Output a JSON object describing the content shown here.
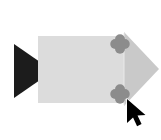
{
  "canvas": {
    "name": "shape-canvas",
    "width": 161,
    "height": 140,
    "background_color": "#ffffff",
    "title": "Block Arrow Shape Selection"
  },
  "shapes": [
    {
      "id": "left-black-triangle",
      "label": "Black Triangle Marker",
      "type": "triangle",
      "fill_color": "#1c1c1c",
      "points": "14,44 14,98 40,80 40,62",
      "direction": "right"
    },
    {
      "id": "arrow-body",
      "label": "Arrow Body Rectangle",
      "type": "rectangle",
      "fill_color": "#dcdcdc",
      "x": 38,
      "y": 36,
      "width": 86,
      "height": 67
    },
    {
      "id": "arrow-head",
      "label": "Arrow Head Triangle",
      "type": "triangle",
      "fill_color": "#c9c9c9",
      "points": "124,32 159,69 124,106",
      "direction": "right"
    },
    {
      "id": "arrow-head-divider",
      "label": "Arrow Head Divider Line",
      "type": "line",
      "stroke_color": "#eaeaea",
      "x1": 124,
      "y1": 33,
      "x2": 124,
      "y2": 105
    }
  ],
  "handles": {
    "label": "Connection Handles",
    "fill_color": "#8c8c8c",
    "shape": "quatrefoil",
    "items": [
      {
        "id": "handle-top",
        "label": "Top Connection Handle",
        "cx": 120,
        "cy": 44,
        "radius": 5.0,
        "state": "idle"
      },
      {
        "id": "handle-bottom",
        "label": "Bottom Connection Handle",
        "cx": 120,
        "cy": 94,
        "radius": 5.0,
        "state": "hovered"
      }
    ]
  },
  "cursor": {
    "id": "mouse-cursor",
    "label": "Mouse Pointer",
    "type": "arrow-pointer",
    "fill_color": "#000000",
    "outline_color": "#ffffff",
    "tip_x": 127,
    "tip_y": 99,
    "rotation_deg": 0
  },
  "a11y": {
    "canvas_description": "Canvas showing a right-pointing block arrow with two connection handles and a black triangle marker, with a mouse cursor near the lower handle."
  }
}
